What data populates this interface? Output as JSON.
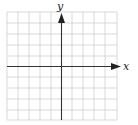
{
  "diagram": {
    "type": "coordinate-plane",
    "x_axis_label": "x",
    "y_axis_label": "y",
    "grid": {
      "columns": 10,
      "rows": 10,
      "cell_px": 11
    },
    "colors": {
      "grid": "#cfcfcf",
      "axis": "#333333",
      "background": "#ffffff"
    }
  }
}
